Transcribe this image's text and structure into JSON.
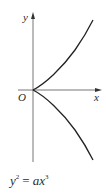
{
  "diagram": {
    "axes": {
      "x_label": "x",
      "y_label": "y",
      "origin_label": "O"
    },
    "curve": {
      "name": "semicubical-parabola",
      "stroke_color": "#222222",
      "branches": [
        "upper",
        "lower"
      ]
    },
    "equation": {
      "lhs_base": "y",
      "lhs_exp": "2",
      "equals": "=",
      "rhs_coef": "ax",
      "rhs_exp": "3"
    },
    "colors": {
      "axis": "#555555",
      "curve": "#222222",
      "text": "#2a2a2a",
      "background": "#ffffff"
    }
  }
}
